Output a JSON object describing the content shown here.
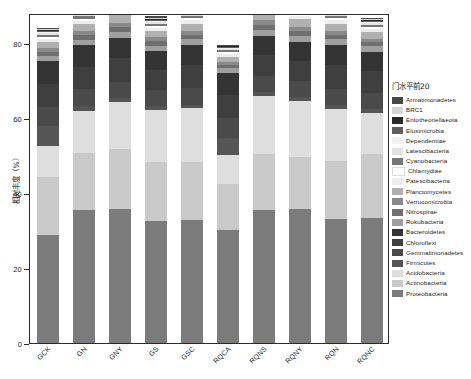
{
  "chart_data": {
    "type": "bar",
    "title": "",
    "subtitle": "",
    "xlabel": "",
    "ylabel": "相对丰度（%）",
    "ylim": [
      0,
      88
    ],
    "yticks": [
      0,
      20,
      40,
      60,
      80
    ],
    "ytick_labels": [
      "0",
      "20",
      "40",
      "60",
      "80"
    ],
    "grid": false,
    "stacked": true,
    "legend_title": "门水平前20",
    "legend_position": "right",
    "categories": [
      "GCK",
      "GN",
      "GNY",
      "GS",
      "GSC",
      "RQCA",
      "RQNS",
      "RQNY",
      "RQN",
      "RQNC"
    ],
    "series": [
      {
        "name": "Proteobacteria",
        "color": "#7b7b7b",
        "values": [
          28.8,
          35.4,
          35.7,
          32.6,
          32.8,
          30.2,
          35.6,
          35.7,
          33.1,
          33.3
        ]
      },
      {
        "name": "Actinobacteria",
        "color": "#c9c9c9",
        "values": [
          15.4,
          15.2,
          16.1,
          15.7,
          15.4,
          12.3,
          14.7,
          13.8,
          15.4,
          17.2
        ]
      },
      {
        "name": "Acidobacteria",
        "color": "#dedede",
        "values": [
          8.3,
          11.3,
          12.4,
          13.9,
          14.4,
          7.7,
          15.7,
          15.0,
          13.9,
          10.8
        ]
      },
      {
        "name": "Firmicutes",
        "color": "#555555",
        "values": [
          5.4,
          1.2,
          1.1,
          1.0,
          1.0,
          4.6,
          1.0,
          1.1,
          1.0,
          1.0
        ]
      },
      {
        "name": "Gemmatimonadetes",
        "color": "#4a4a4a",
        "values": [
          5.1,
          4.6,
          4.4,
          4.2,
          4.5,
          5.2,
          4.2,
          4.3,
          4.4,
          4.3
        ]
      },
      {
        "name": "Chloroflexi",
        "color": "#3f3f3f",
        "values": [
          6.2,
          6.0,
          6.2,
          5.5,
          6.1,
          6.2,
          5.6,
          5.4,
          6.3,
          5.9
        ]
      },
      {
        "name": "Bacteroidetes",
        "color": "#343434",
        "values": [
          5.9,
          5.7,
          5.4,
          4.9,
          5.3,
          5.9,
          5.2,
          5.1,
          5.4,
          5.2
        ]
      },
      {
        "name": "Rokubacteria",
        "color": "#9f9f9f",
        "values": [
          1.4,
          1.5,
          1.6,
          1.5,
          1.5,
          1.2,
          1.6,
          1.6,
          1.5,
          1.4
        ]
      },
      {
        "name": "Nitrospirae",
        "color": "#6f6f6f",
        "values": [
          1.1,
          1.2,
          1.3,
          1.2,
          1.2,
          0.9,
          1.3,
          1.3,
          1.2,
          1.1
        ]
      },
      {
        "name": "Verrucomicrobia",
        "color": "#8a8a8a",
        "values": [
          1.0,
          1.1,
          1.2,
          1.0,
          1.1,
          0.8,
          1.2,
          1.1,
          1.1,
          1.0
        ]
      },
      {
        "name": "Planctomycetes",
        "color": "#b0b0b0",
        "values": [
          1.6,
          1.8,
          2.0,
          1.7,
          1.8,
          1.4,
          2.0,
          1.9,
          1.8,
          1.7
        ]
      },
      {
        "name": "Patescibacteria",
        "color": "#ededed",
        "values": [
          0.9,
          1.0,
          1.1,
          0.9,
          1.0,
          0.8,
          1.1,
          1.0,
          1.0,
          0.9
        ]
      },
      {
        "name": "Chlamydiae",
        "color": "#ffffff",
        "values": [
          0.5,
          0.5,
          0.6,
          0.5,
          0.5,
          0.4,
          0.6,
          0.5,
          0.5,
          0.5
        ]
      },
      {
        "name": "Cyanobacteria",
        "color": "#777777",
        "values": [
          0.6,
          0.7,
          0.8,
          0.6,
          0.7,
          0.5,
          0.8,
          0.7,
          0.7,
          0.6
        ]
      },
      {
        "name": "Latescibacteria",
        "color": "#e3e3e3",
        "values": [
          0.4,
          0.5,
          0.5,
          0.4,
          0.5,
          0.3,
          0.5,
          0.5,
          0.5,
          0.4
        ]
      },
      {
        "name": "Dependentiae",
        "color": "#f2f2f2",
        "values": [
          0.3,
          0.3,
          0.4,
          0.3,
          0.3,
          0.3,
          0.4,
          0.3,
          0.3,
          0.3
        ]
      },
      {
        "name": "Elusimicrobia",
        "color": "#606060",
        "values": [
          0.3,
          0.3,
          0.4,
          0.3,
          0.3,
          0.2,
          0.4,
          0.3,
          0.3,
          0.3
        ]
      },
      {
        "name": "Entotheonellaeota",
        "color": "#2a2a2a",
        "values": [
          0.3,
          0.3,
          0.3,
          0.3,
          0.3,
          0.2,
          0.3,
          0.3,
          0.3,
          0.3
        ]
      },
      {
        "name": "BRC1",
        "color": "#d6d6d6",
        "values": [
          0.3,
          0.3,
          0.3,
          0.3,
          0.3,
          0.2,
          0.3,
          0.3,
          0.3,
          0.3
        ]
      },
      {
        "name": "Armatimonadetes",
        "color": "#484848",
        "values": [
          0.3,
          0.3,
          0.3,
          0.3,
          0.3,
          0.2,
          0.3,
          0.3,
          0.3,
          0.3
        ]
      }
    ],
    "legend_order": [
      "Armatimonadetes",
      "BRC1",
      "Entotheonellaeota",
      "Elusimicrobia",
      "Dependentiae",
      "Latescibacteria",
      "Cyanobacteria",
      "Chlamydiae",
      "Patescibacteria",
      "Planctomycetes",
      "Verrucomicrobia",
      "Nitrospirae",
      "Rokubacteria",
      "Bacteroidetes",
      "Chloroflexi",
      "Gemmatimonadetes",
      "Firmicutes",
      "Acidobacteria",
      "Actinobacteria",
      "Proteobacteria"
    ]
  },
  "figure": {
    "background_color": "#ffffff",
    "frame_color": "#2b2b2b",
    "text_color": "#1d1d1d"
  }
}
